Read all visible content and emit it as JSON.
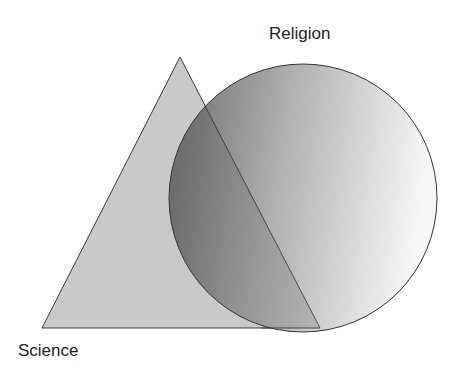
{
  "diagram": {
    "labels": {
      "circle": "Religion",
      "triangle": "Science"
    },
    "shapes": {
      "triangle": {
        "name": "Science",
        "fill": "#c8c8c8",
        "stroke": "#444444"
      },
      "circle": {
        "name": "Religion",
        "gradient_dark": "#6a6a6a",
        "gradient_light": "#f4f4f4",
        "stroke": "#333333"
      }
    }
  }
}
